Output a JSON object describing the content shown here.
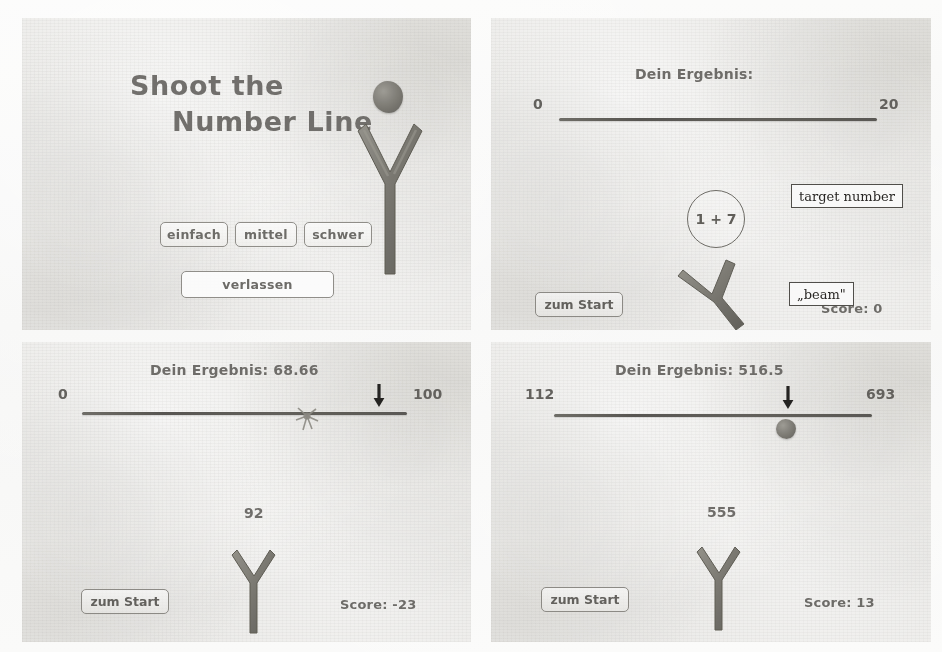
{
  "figure": {
    "panels": [
      {
        "id": "start-screen",
        "title_line1": "Shoot the",
        "title_line2": "Number Line",
        "buttons": {
          "easy": "einfach",
          "medium": "mittel",
          "hard": "schwer",
          "quit": "verlassen"
        }
      },
      {
        "id": "aiming-screen",
        "result_label": "Dein Ergebnis:",
        "line_min": "0",
        "line_max": "20",
        "target_number": "1 + 7",
        "start_button": "zum Start",
        "score": "Score: 0",
        "annotations": {
          "target": "target number",
          "beam": "„beam\""
        }
      },
      {
        "id": "result-screen-easy",
        "result_label": "Dein Ergebnis: 68.66",
        "line_min": "0",
        "line_max": "100",
        "target_number": "92",
        "start_button": "zum Start",
        "score": "Score: -23"
      },
      {
        "id": "result-screen-hard",
        "result_label": "Dein Ergebnis: 516.5",
        "line_min": "112",
        "line_max": "693",
        "target_number": "555",
        "start_button": "zum Start",
        "score": "Score: 13"
      }
    ],
    "icons": {
      "slingshot": "slingshot-icon",
      "stone": "stone-icon",
      "arrow": "down-arrow-marker-icon",
      "splash": "impact-splash-icon"
    },
    "colors": {
      "paper": "#f6f6f5",
      "screen": "#e6e5e2",
      "ink": "#6a6864",
      "line": "#57554f",
      "annotation": "#23211f"
    }
  }
}
